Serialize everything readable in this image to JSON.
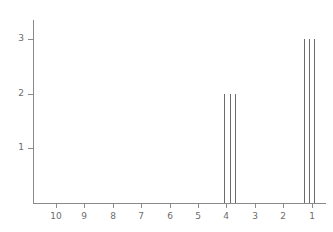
{
  "chart_data": {
    "type": "bar",
    "title": "",
    "subtitle": "",
    "xlabel": "",
    "ylabel": "",
    "grid": false,
    "legend": null,
    "x_axis": {
      "reversed": true,
      "ticks": [
        10,
        9,
        8,
        7,
        6,
        5,
        4,
        3,
        2,
        1
      ],
      "tick_labels": [
        "10",
        "9",
        "8",
        "7",
        "6",
        "5",
        "4",
        "3",
        "2",
        "1"
      ],
      "xlim": [
        10.8,
        0.5
      ]
    },
    "y_axis": {
      "ticks": [
        1,
        2,
        3
      ],
      "tick_labels": [
        "1",
        "2",
        "3"
      ],
      "ylim": [
        0,
        3.35
      ]
    },
    "peaks": [
      {
        "x": 4.07,
        "y": 2
      },
      {
        "x": 3.89,
        "y": 2
      },
      {
        "x": 3.71,
        "y": 2
      },
      {
        "x": 1.28,
        "y": 3
      },
      {
        "x": 1.1,
        "y": 3
      },
      {
        "x": 0.93,
        "y": 3
      }
    ],
    "colors": {
      "axis": "#8a8a8a",
      "tick_label": "#6d6d6d",
      "peak": "#6b6b6b",
      "background": "#ffffff"
    }
  }
}
